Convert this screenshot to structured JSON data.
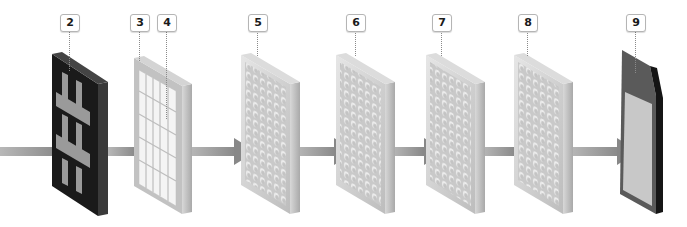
{
  "diagram": {
    "callouts": [
      {
        "label": "2",
        "x": 60,
        "y": 14,
        "line_to": 66
      },
      {
        "label": "3",
        "x": 130,
        "y": 14,
        "line_to": 60
      },
      {
        "label": "4",
        "x": 157,
        "y": 14,
        "line_to": 118
      },
      {
        "label": "5",
        "x": 248,
        "y": 14,
        "line_to": 55
      },
      {
        "label": "6",
        "x": 346,
        "y": 14,
        "line_to": 55
      },
      {
        "label": "7",
        "x": 432,
        "y": 14,
        "line_to": 55
      },
      {
        "label": "8",
        "x": 518,
        "y": 14,
        "line_to": 55
      },
      {
        "label": "9",
        "x": 626,
        "y": 14,
        "line_to": 72
      }
    ],
    "layers": [
      {
        "id": "layer-2",
        "type": "dark-grid"
      },
      {
        "id": "layer-3-4",
        "type": "light-grid"
      },
      {
        "id": "layer-5",
        "type": "textured"
      },
      {
        "id": "layer-6",
        "type": "textured"
      },
      {
        "id": "layer-7",
        "type": "textured"
      },
      {
        "id": "layer-8",
        "type": "textured"
      },
      {
        "id": "layer-9",
        "type": "screen"
      }
    ],
    "colors": {
      "arrow": "#8c8c8c",
      "dark_panel": "#1c1c1c",
      "light_panel": "#c8c8c8",
      "callout_border": "#b5b5b5"
    }
  }
}
